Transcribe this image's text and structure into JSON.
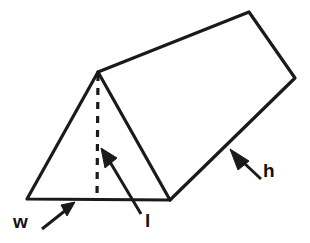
{
  "figure": {
    "shape": "triangular-prism",
    "background_color": "#ffffff",
    "line_color": "#1a1a1a",
    "labels": [
      {
        "key": "w",
        "text": "w",
        "meaning": "width",
        "x": 13,
        "y": 212
      },
      {
        "key": "l",
        "text": "l",
        "meaning": "length",
        "x": 145,
        "y": 211
      },
      {
        "key": "h",
        "text": "h",
        "meaning": "height",
        "x": 263,
        "y": 161
      }
    ],
    "vertices": {
      "front_apex": [
        98,
        72
      ],
      "front_base_left": [
        27,
        199
      ],
      "front_base_right": [
        170,
        200
      ],
      "back_apex": [
        249,
        12
      ],
      "back_top_right": [
        295,
        78
      ]
    },
    "edges": {
      "front_triangle": "27,199 98,72 170,200 27,199",
      "top_ridge": "98,72 249,12",
      "back_right_face": "249,12 295,78 170,200",
      "dashed_altitude": "98,72 97,200"
    },
    "arrows": [
      {
        "key": "w-arrow",
        "from": [
          42,
          229
        ],
        "to": [
          73,
          205
        ]
      },
      {
        "key": "l-arrow",
        "from": [
          141,
          214
        ],
        "to": [
          104,
          152
        ]
      },
      {
        "key": "h-arrow",
        "from": [
          261,
          179
        ],
        "to": [
          232,
          151
        ]
      }
    ]
  }
}
